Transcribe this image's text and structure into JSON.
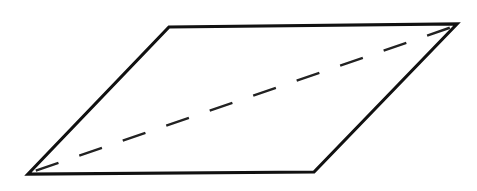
{
  "figure": {
    "shape": "parallelogram",
    "stroke_color": "#111111",
    "background": "#ffffff",
    "vertices": {
      "bottom_left": [
        28,
        174
      ],
      "top_left": [
        169,
        27
      ],
      "top_right": [
        457,
        24
      ],
      "bottom_right": [
        314,
        172
      ]
    },
    "diagonal": {
      "style": "dashed",
      "from": "bottom_left",
      "to": "top_right"
    }
  }
}
